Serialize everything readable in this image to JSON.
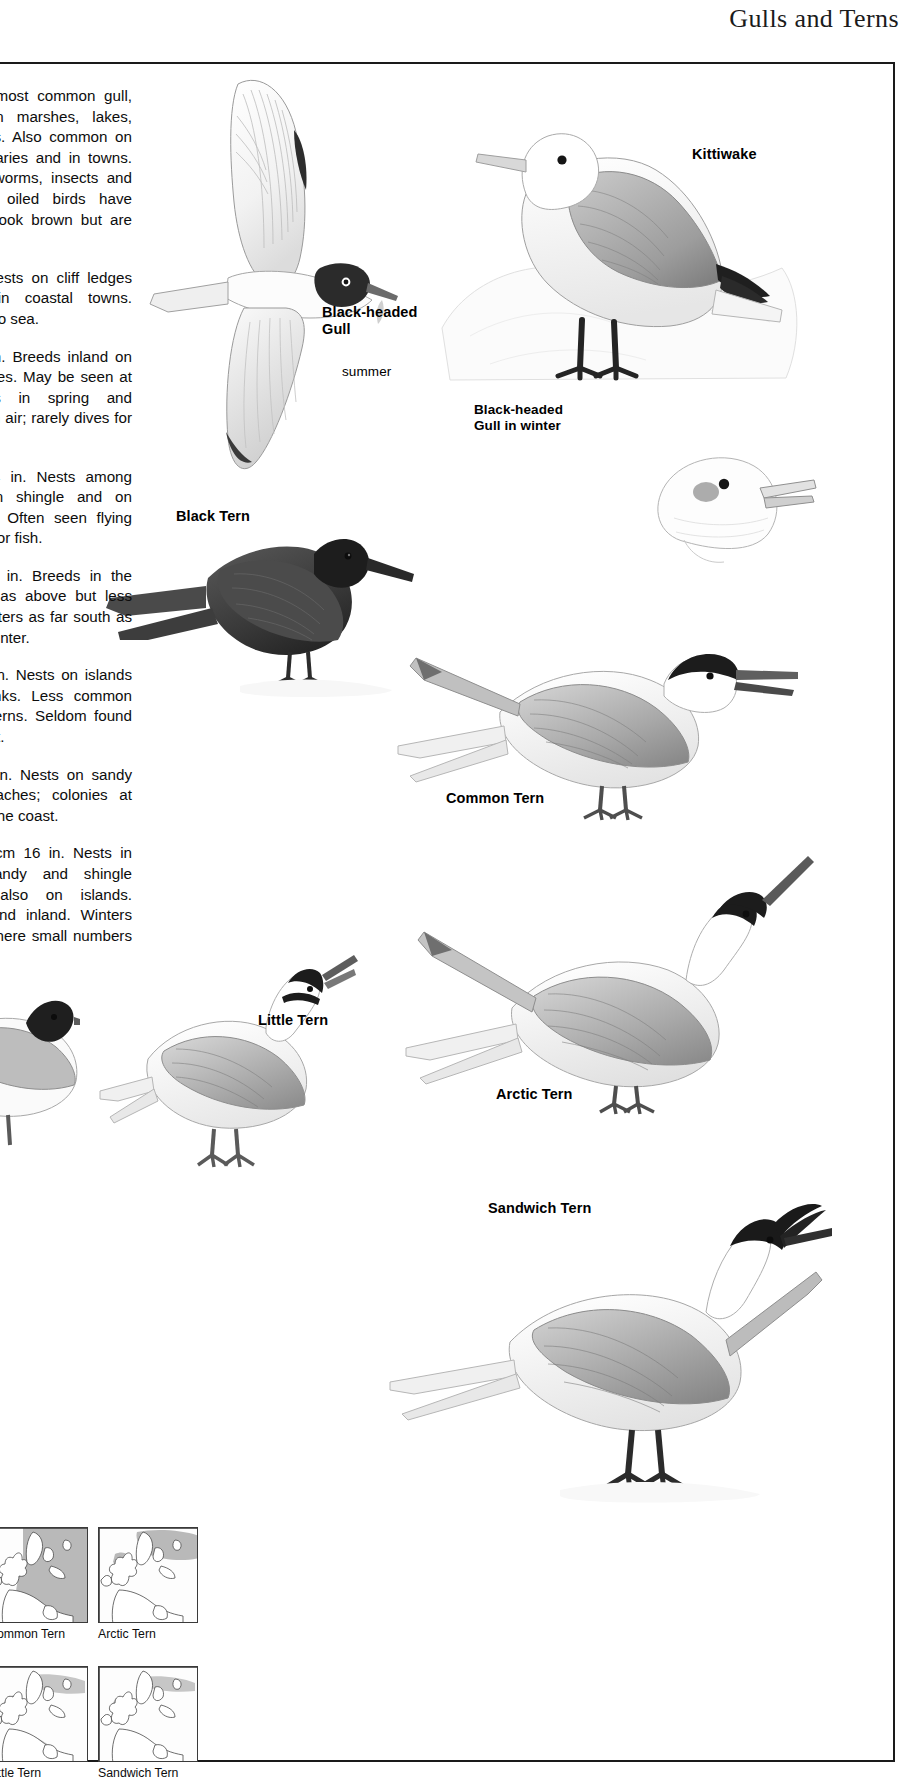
{
  "header": {
    "title": "Gulls and Terns"
  },
  "text_column": {
    "paragraphs": [
      {
        "sci": "ridibundus",
        "body": " The most common gull, found inland on marshes, lakes, ponds and rivers. Also common on coasts and estuaries and in towns. Feeds on fish, worms, insects and garbage. Badly oiled birds have black legs and look brown but are not rare."
      },
      {
        "sci": "",
        "body": "41 cm 16 in. Nests on cliff ledges and buildings in coastal towns. Winters well out to sea."
      },
      {
        "sci": "iger",
        "body": " 24 cm 10 in. Breeds inland on lakes and marshes. May be seen at coastal lagoons in spring and autumn. Feeds in air; rarely dives for fish."
      },
      {
        "sci": "undo",
        "body": " 36 cm 14 in. Nests among sand dunes, on shingle and on offshore islands. Often seen flying over sea, diving for fish."
      },
      {
        "sci": "saea",
        "body": " 36 cm 14 in. Breeds in the kinds of places as above but less likely inland. Winters as far south as the Antarctic in winter."
      },
      {
        "sci": "gallii",
        "body": " 38 cm 15 in. Nests on islands and shingle banks. Less common than the other terns. Seldom found far from the coast."
      },
      {
        "sci": "ons",
        "body": " 24 cm 9.5 in. Nests on sandy and shingle beaches; colonies at places all round the coast."
      },
      {
        "sci": "andvicensis",
        "body": " 41 cm 16 in. Nests in colonies on sandy and shingle beaches and also on islands. Occasionally found inland. Winters south to Kent, where small numbers are recorded."
      }
    ]
  },
  "illustration_labels": {
    "black_headed_gull": "Black-headed\nGull",
    "black_headed_gull_season": "summer",
    "black_headed_gull_winter": "Black-headed\nGull in winter",
    "kittiwake": "Kittiwake",
    "black_tern": "Black Tern",
    "common_tern": "Common Tern",
    "arctic_tern": "Arctic Tern",
    "little_tern": "Little Tern",
    "sandwich_tern": "Sandwich Tern"
  },
  "maps": [
    {
      "caption": "Common Tern",
      "range": "wide"
    },
    {
      "caption": "Arctic Tern",
      "range": "north"
    },
    {
      "caption": "Little Tern",
      "range": "coastal"
    },
    {
      "caption": "Sandwich Tern",
      "range": "coastal-north"
    }
  ],
  "colors": {
    "ink": "#111111",
    "rule": "#1a1a1a",
    "map_fill": "#b9b9b9",
    "map_line": "#4a4a4a",
    "plumage_light": "#e9e9e9",
    "plumage_mid": "#b0b0b0",
    "plumage_dark": "#3c3c3c",
    "black": "#1c1c1c",
    "leg": "#6e6e6e"
  }
}
